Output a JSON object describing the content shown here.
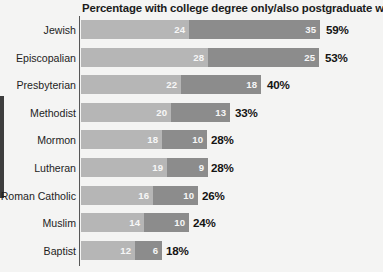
{
  "chart_data": {
    "type": "bar",
    "title": "Percentage with college degree only/also postgraduate work",
    "xlabel": "",
    "ylabel": "",
    "orientation": "horizontal",
    "stacked": true,
    "grid": false,
    "legend_position": "none",
    "axis_origin": 0,
    "categories": [
      "Jewish",
      "Episcopalian",
      "Presbyterian",
      "Methodist",
      "Mormon",
      "Lutheran",
      "Roman Catholic",
      "Muslim",
      "Baptist"
    ],
    "series": [
      {
        "name": "college degree only",
        "color": "#b6b6b6",
        "values": [
          24,
          28,
          22,
          20,
          18,
          19,
          16,
          14,
          12
        ]
      },
      {
        "name": "also postgraduate work",
        "color": "#8c8c8c",
        "values": [
          35,
          25,
          18,
          13,
          10,
          9,
          10,
          10,
          6
        ]
      }
    ],
    "totals": [
      59,
      53,
      40,
      33,
      28,
      28,
      26,
      24,
      18
    ],
    "total_labels": [
      "59%",
      "53%",
      "40%",
      "33%",
      "28%",
      "28%",
      "26%",
      "24%",
      "18%"
    ]
  },
  "rows": [
    {
      "label": "Jewish",
      "seg1_value": "24",
      "seg2_value": "35",
      "total_label": "59%",
      "seg1_px": 108,
      "seg2_px": 131,
      "total_x": 326
    },
    {
      "label": "Episcopalian",
      "seg1_value": "28",
      "seg2_value": "25",
      "total_label": "53%",
      "seg1_px": 127,
      "seg2_px": 111,
      "total_x": 325
    },
    {
      "label": "Presbyterian",
      "seg1_value": "22",
      "seg2_value": "18",
      "total_label": "40%",
      "seg1_px": 100,
      "seg2_px": 80,
      "total_x": 267
    },
    {
      "label": "Methodist",
      "seg1_value": "20",
      "seg2_value": "13",
      "total_label": "33%",
      "seg1_px": 90,
      "seg2_px": 59,
      "total_x": 235
    },
    {
      "label": "Mormon",
      "seg1_value": "18",
      "seg2_value": "10",
      "total_label": "28%",
      "seg1_px": 81,
      "seg2_px": 45,
      "total_x": 211
    },
    {
      "label": "Lutheran",
      "seg1_value": "19",
      "seg2_value": "9",
      "total_label": "28%",
      "seg1_px": 86,
      "seg2_px": 41,
      "total_x": 211
    },
    {
      "label": "Roman Catholic",
      "seg1_value": "16",
      "seg2_value": "10",
      "total_label": "26%",
      "seg1_px": 72,
      "seg2_px": 45,
      "total_x": 202
    },
    {
      "label": "Muslim",
      "seg1_value": "14",
      "seg2_value": "10",
      "total_label": "24%",
      "seg1_px": 63,
      "seg2_px": 45,
      "total_x": 193
    },
    {
      "label": "Baptist",
      "seg1_value": "12",
      "seg2_value": "6",
      "total_label": "18%",
      "seg1_px": 54,
      "seg2_px": 27,
      "total_x": 166
    }
  ]
}
